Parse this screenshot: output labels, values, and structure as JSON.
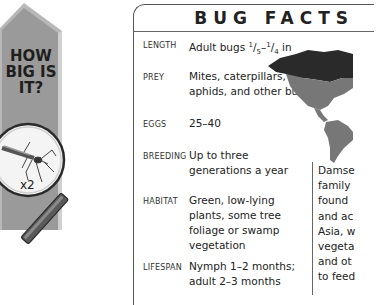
{
  "banner": {
    "line1": "HOW",
    "line2": "BIG IS",
    "line3": "IT?",
    "color": "#9a9a9a"
  },
  "magnifier": {
    "scale_label": "x2",
    "subject": "damsel bug illustration"
  },
  "card": {
    "title": "BUG FACTS",
    "facts": [
      {
        "label": "Length",
        "value": "Adult bugs",
        "fraction_a": {
          "num": "1",
          "den": "5"
        },
        "fraction_b": {
          "num": "1",
          "den": "4"
        },
        "unit": "in"
      },
      {
        "label": "Prey",
        "value_lines": [
          "Mites, caterpillars,",
          "aphids, and other bugs"
        ]
      },
      {
        "label": "Eggs",
        "value": "25–40"
      },
      {
        "label": "Breeding",
        "value_lines": [
          "Up to three",
          "generations a year"
        ]
      },
      {
        "label": "Habitat",
        "value_lines": [
          "Green, low-lying",
          "plants,  some tree",
          "foliage or swamp",
          "vegetation"
        ]
      },
      {
        "label": "Lifespan",
        "value_lines": [
          "Nymph 1–2 months;",
          "adult 2–3 months"
        ]
      }
    ],
    "map": {
      "label": "range-map-americas",
      "dark_color": "#2a2a2a",
      "mid_color": "#7a7a7a"
    },
    "side_text_lines": [
      "Damse",
      "family",
      "found",
      "and ac",
      "Asia, w",
      "vegeta",
      "and ot",
      "to feed"
    ]
  }
}
